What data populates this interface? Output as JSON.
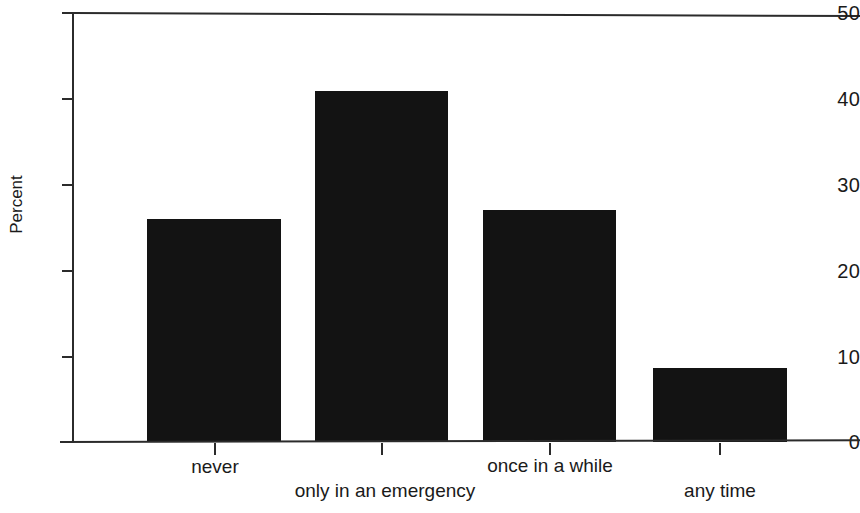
{
  "chart_data": {
    "type": "bar",
    "title": "",
    "subtitle": "",
    "xlabel": "",
    "ylabel": "Percent",
    "categories": [
      "never",
      "only in an emergency",
      "once in a while",
      "any time"
    ],
    "values": [
      26,
      40.9,
      27,
      8.6
    ],
    "series": [
      {
        "name": "Percent",
        "values": [
          26,
          40.9,
          27,
          8.6
        ]
      }
    ],
    "ylim": [
      0,
      50
    ],
    "ytick_labels": [
      "0",
      "10",
      "20",
      "30",
      "40",
      "50"
    ],
    "ytick_values": [
      0,
      10,
      20,
      30,
      40,
      50
    ],
    "grid": false,
    "legend": false,
    "legend_position": "none",
    "bar_color": "#131313",
    "axis_color": "#2b2b2b",
    "background_color": "#ffffff",
    "label_stagger": [
      "upper",
      "lower",
      "upper",
      "lower"
    ],
    "annotations": []
  },
  "axis": {
    "y_title": "Percent"
  }
}
